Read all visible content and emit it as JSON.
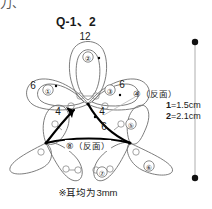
{
  "page": {
    "corner_mark": "刀、",
    "title": "Q-1、2",
    "footnote": "※耳均为3mm"
  },
  "legend": {
    "line1_key": "1",
    "line1_eq": "=1.5cm",
    "line2_key": "2",
    "line2_eq": "=2.1cm",
    "scale_dot_color": "#111111",
    "scale_line_color": "#9a9a9a"
  },
  "diagram": {
    "outline_color": "#6e6e6e",
    "bold_color": "#000000",
    "petals": [
      {
        "id": "petal-1",
        "label": "①",
        "x": 48,
        "y": 90
      },
      {
        "id": "petal-2",
        "label": "②",
        "x": 88,
        "y": 57
      },
      {
        "id": "petal-3",
        "label": "③",
        "x": 110,
        "y": 90
      },
      {
        "id": "petal-5",
        "label": "⑤",
        "x": 131,
        "y": 124
      },
      {
        "id": "petal-6",
        "label": "⑥",
        "x": 149,
        "y": 166
      },
      {
        "id": "petal-7",
        "label": "⑦",
        "x": 102,
        "y": 172
      }
    ],
    "callouts": [
      {
        "id": "callout-4-reverse",
        "label": "④（反面）",
        "x": 133,
        "y": 94
      },
      {
        "id": "callout-8-reverse",
        "label": "⑧（反面）",
        "x": 68,
        "y": 147
      }
    ],
    "segment_labels": [
      {
        "id": "seg-12-top",
        "value": "12",
        "x": 85,
        "y": 37
      },
      {
        "id": "seg-6-left",
        "value": "6",
        "x": 33,
        "y": 86
      },
      {
        "id": "seg-6-right",
        "value": "6",
        "x": 122,
        "y": 85
      },
      {
        "id": "seg-4-left",
        "value": "4",
        "x": 58,
        "y": 112
      },
      {
        "id": "seg-4-right",
        "value": "4",
        "x": 102,
        "y": 112
      },
      {
        "id": "seg-6-center",
        "value": "6",
        "x": 104,
        "y": 127
      }
    ]
  }
}
